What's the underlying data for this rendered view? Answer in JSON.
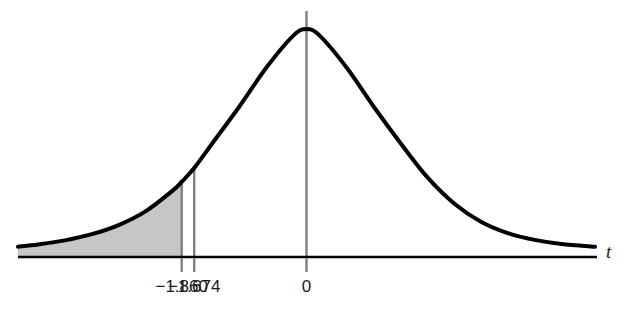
{
  "chart_data": {
    "type": "area",
    "title": "",
    "subtitle": "",
    "xlabel": "t",
    "ylabel": "",
    "grid": false,
    "legend": null,
    "distribution": "t-distribution density curve",
    "xlim": [
      -4.3,
      4.3
    ],
    "ylim": [
      0,
      1.0
    ],
    "x_tick_values": [
      -1.86,
      -1.674,
      0
    ],
    "x_tick_labels": [
      "−1.860",
      "−1.674",
      "0"
    ],
    "reference_lines": [
      {
        "x": -1.86,
        "label": "−1.860",
        "color": "#808080",
        "top_at_curve": true
      },
      {
        "x": -1.674,
        "label": "−1.674",
        "color": "#808080",
        "top_at_curve": true
      },
      {
        "x": 0,
        "label": "0",
        "color": "#808080",
        "top_at_curve": true
      }
    ],
    "shaded_region": {
      "from": -4.3,
      "to": -1.86,
      "fill": "#c6c6c6",
      "description": "left tail area below t = −1.860"
    },
    "curve": {
      "color": "#000000",
      "line_width": 4,
      "points_x": [
        -4.3,
        -4.0,
        -3.6,
        -3.2,
        -2.8,
        -2.4,
        -2.0,
        -1.86,
        -1.674,
        -1.4,
        -1.0,
        -0.6,
        -0.2,
        0,
        0.2,
        0.6,
        1.0,
        1.4,
        1.8,
        2.2,
        2.6,
        3.0,
        3.4,
        3.8,
        4.3
      ],
      "points_y": [
        0.045,
        0.055,
        0.073,
        0.1,
        0.14,
        0.2,
        0.29,
        0.33,
        0.39,
        0.5,
        0.66,
        0.83,
        0.97,
        1.0,
        0.97,
        0.83,
        0.66,
        0.5,
        0.35,
        0.235,
        0.155,
        0.105,
        0.075,
        0.057,
        0.045
      ]
    },
    "axis": {
      "color": "#000000",
      "line_width": 2.5
    }
  },
  "labels": {
    "tick_left": "−1.860",
    "tick_mid": "−1.674",
    "tick_zero": "0",
    "axis_t": "t"
  },
  "colors": {
    "curve": "#000000",
    "axis": "#000000",
    "reference_line": "#808080",
    "shading": "#c6c6c6",
    "background": "#ffffff",
    "text": "#1a1a1a"
  }
}
